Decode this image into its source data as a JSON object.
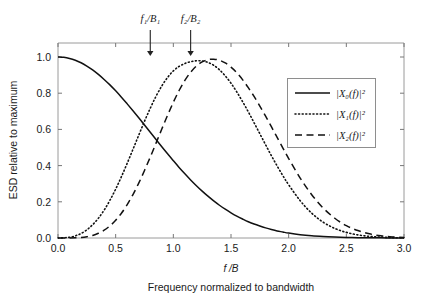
{
  "chart_data": {
    "type": "line",
    "title": "",
    "xlabel": "f /B",
    "ylabel": "ESD relative to maximum",
    "caption": "Frequency normalized to bandwidth",
    "xlim": [
      0.0,
      3.0
    ],
    "ylim": [
      0.0,
      1.05
    ],
    "grid": false,
    "legend_position": "upper-right",
    "xticks": [
      "0.0",
      "0.5",
      "1.0",
      "1.5",
      "2.0",
      "2.5",
      "3.0"
    ],
    "xtick_values": [
      0.0,
      0.5,
      1.0,
      1.5,
      2.0,
      2.5,
      3.0
    ],
    "yticks": [
      "0.0",
      "0.2",
      "0.4",
      "0.6",
      "0.8",
      "1.0"
    ],
    "ytick_values": [
      0.0,
      0.2,
      0.4,
      0.6,
      0.8,
      1.0
    ],
    "x": [
      0.0,
      0.05,
      0.1,
      0.15,
      0.2,
      0.25,
      0.3,
      0.35,
      0.4,
      0.45,
      0.5,
      0.55,
      0.6,
      0.65,
      0.7,
      0.75,
      0.8,
      0.85,
      0.9,
      0.95,
      1.0,
      1.05,
      1.1,
      1.15,
      1.2,
      1.25,
      1.3,
      1.35,
      1.4,
      1.45,
      1.5,
      1.55,
      1.6,
      1.65,
      1.7,
      1.75,
      1.8,
      1.85,
      1.9,
      1.95,
      2.0,
      2.1,
      2.2,
      2.3,
      2.4,
      2.5,
      2.6,
      2.7,
      2.8,
      2.9,
      3.0
    ],
    "series": [
      {
        "name": "|X0(f)|^2",
        "style": "solid",
        "color": "#111111",
        "peak_x": 0.0,
        "values": [
          1.0,
          0.998,
          0.992,
          0.982,
          0.968,
          0.95,
          0.929,
          0.904,
          0.876,
          0.846,
          0.813,
          0.778,
          0.741,
          0.703,
          0.664,
          0.624,
          0.584,
          0.544,
          0.504,
          0.465,
          0.427,
          0.39,
          0.355,
          0.321,
          0.289,
          0.259,
          0.231,
          0.205,
          0.181,
          0.159,
          0.139,
          0.121,
          0.105,
          0.09,
          0.077,
          0.066,
          0.056,
          0.047,
          0.039,
          0.033,
          0.027,
          0.018,
          0.012,
          0.008,
          0.005,
          0.003,
          0.002,
          0.001,
          0.001,
          0.0,
          0.0
        ]
      },
      {
        "name": "|X1(f)|^2",
        "style": "dotted",
        "color": "#111111",
        "peak_x": 0.8,
        "values": [
          0.0,
          0.001,
          0.004,
          0.012,
          0.025,
          0.045,
          0.073,
          0.109,
          0.154,
          0.208,
          0.27,
          0.339,
          0.413,
          0.49,
          0.568,
          0.645,
          0.717,
          0.783,
          0.84,
          0.887,
          0.923,
          0.948,
          0.964,
          0.974,
          0.979,
          0.978,
          0.97,
          0.954,
          0.929,
          0.896,
          0.855,
          0.807,
          0.754,
          0.697,
          0.637,
          0.576,
          0.515,
          0.455,
          0.398,
          0.344,
          0.294,
          0.206,
          0.137,
          0.087,
          0.053,
          0.031,
          0.017,
          0.009,
          0.005,
          0.002,
          0.001
        ]
      },
      {
        "name": "|X2(f)|^2",
        "style": "dashed",
        "color": "#111111",
        "peak_x": 1.17,
        "values": [
          0.0,
          0.0,
          0.0,
          0.001,
          0.003,
          0.007,
          0.014,
          0.026,
          0.043,
          0.067,
          0.098,
          0.137,
          0.184,
          0.24,
          0.303,
          0.373,
          0.447,
          0.524,
          0.602,
          0.678,
          0.75,
          0.815,
          0.871,
          0.916,
          0.95,
          0.973,
          0.985,
          0.988,
          0.982,
          0.967,
          0.944,
          0.913,
          0.875,
          0.831,
          0.782,
          0.729,
          0.673,
          0.615,
          0.556,
          0.497,
          0.439,
          0.331,
          0.239,
          0.165,
          0.109,
          0.068,
          0.041,
          0.023,
          0.012,
          0.006,
          0.003
        ]
      }
    ],
    "annotations": [
      {
        "label": "f₁/B₁",
        "x": 0.8,
        "target_y": 1.0
      },
      {
        "label": "f₂/B₂",
        "x": 1.15,
        "target_y": 1.0
      }
    ]
  },
  "legend": {
    "entries": [
      {
        "label": "|X₀(f)|²",
        "style": "solid"
      },
      {
        "label": "|X₁(f)|²",
        "style": "dotted"
      },
      {
        "label": "|X₂(f)|²",
        "style": "dashed"
      }
    ]
  },
  "axes": {
    "x_title": "f /B",
    "y_title": "ESD relative to maximum",
    "caption": "Frequency normalized to bandwidth",
    "x_tick_labels": [
      "0.0",
      "0.5",
      "1.0",
      "1.5",
      "2.0",
      "2.5",
      "3.0"
    ],
    "y_tick_labels": [
      "0.0",
      "0.2",
      "0.4",
      "0.6",
      "0.8",
      "1.0"
    ]
  },
  "annotations": {
    "arrow1_label": "f₁/B₁",
    "arrow2_label": "f₂/B₂"
  },
  "colors": {
    "background": "#ffffff",
    "curve": "#111111",
    "frame": "#9a9a9a",
    "text": "#1a1a1a"
  }
}
